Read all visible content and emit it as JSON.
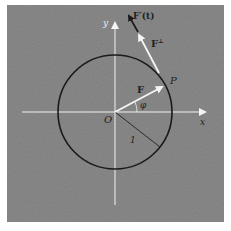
{
  "labels": {
    "y_axis": "y",
    "x_axis": "x",
    "origin": "O",
    "point": "P",
    "vector_f": "F",
    "vector_perp": "F",
    "vector_perp_sup": "⊥",
    "vector_deriv": "F′(t)",
    "angle": "φ",
    "radius": "1"
  },
  "colors": {
    "background": "#8a8a8a",
    "axes": "#f2f2f2",
    "circle": "#1a1a1a",
    "vectors": "#f5f5f5",
    "derivative_vector": "#1a1a1a"
  },
  "geometry_data": {
    "circle_radius_units": 1,
    "angle_phi_deg": 28,
    "radius_line_angle_deg": -38
  }
}
